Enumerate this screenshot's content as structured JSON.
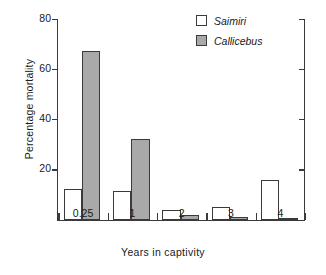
{
  "chart_data": {
    "type": "bar",
    "title": "",
    "xlabel": "Years in captivity",
    "ylabel": "Percentage mortality",
    "categories": [
      "0.25",
      "1",
      "2",
      "3",
      "4"
    ],
    "series": [
      {
        "name": "Saimiri",
        "values": [
          12.5,
          11.5,
          4.0,
          5.5,
          16.0
        ],
        "color": "#ffffff"
      },
      {
        "name": "Callicebus",
        "values": [
          67.5,
          32.5,
          2.0,
          1.5,
          0.5
        ],
        "color": "#a9a9a9"
      }
    ],
    "ylim": [
      0,
      80
    ],
    "yticks": [
      20,
      40,
      60,
      80
    ],
    "ytick_labels": [
      "20",
      "40",
      "60",
      "80"
    ],
    "grid": false,
    "legend_position": "top-right"
  },
  "legend": {
    "entries": [
      {
        "label": "Saimiri"
      },
      {
        "label": "Callicebus"
      }
    ]
  },
  "axes": {
    "y_label": "Percentage mortality",
    "x_label": "Years in captivity",
    "y_ticks": [
      "20",
      "40",
      "60",
      "80"
    ],
    "x_ticks": [
      "0.25",
      "1",
      "2",
      "3",
      "4"
    ]
  },
  "colors": {
    "saimiri_fill": "#ffffff",
    "callicebus_fill": "#a9a9a9",
    "stroke": "#3a3a3a",
    "background": "#ffffff"
  }
}
